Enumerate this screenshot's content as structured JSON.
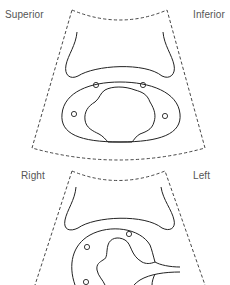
{
  "figure": {
    "panels": [
      {
        "id": "top-view",
        "description": "Sagittal ultrasound fan view",
        "labels": {
          "left": "Superior",
          "right": "Inferior"
        }
      },
      {
        "id": "bottom-view",
        "description": "Transverse ultrasound fan view",
        "labels": {
          "left": "Right",
          "right": "Left"
        }
      }
    ],
    "colors": {
      "line": "#222222",
      "label": "#555555",
      "background": "#ffffff"
    }
  }
}
